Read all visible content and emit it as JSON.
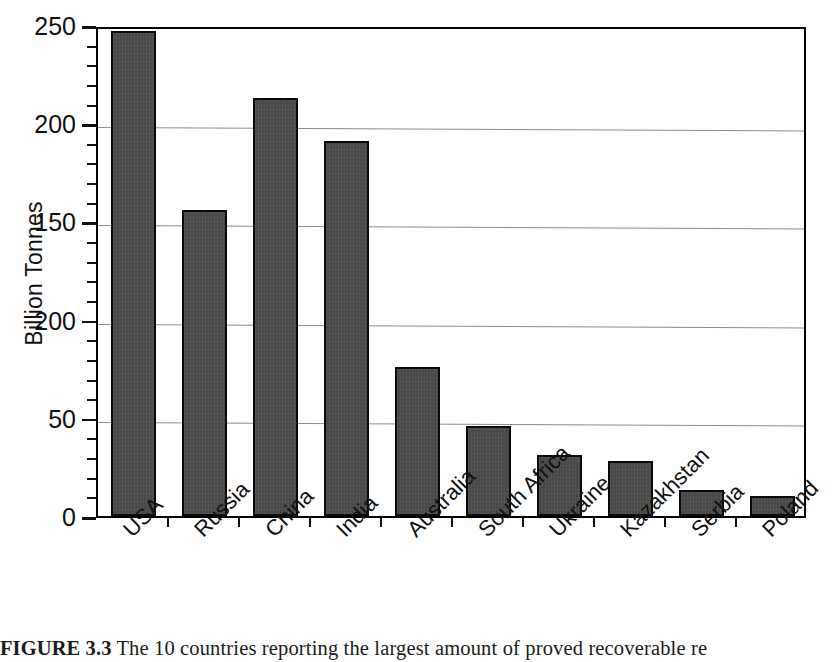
{
  "figure": {
    "caption_label": "FIGURE 3.3",
    "caption_text": " The 10 countries reporting the largest amount of proved recoverable re"
  },
  "axes": {
    "ylabel": "Billion Tonnes",
    "ytick_labels": [
      "250",
      "200",
      "150",
      "200",
      "50",
      "0"
    ],
    "ytick_values": [
      250,
      200,
      150,
      100,
      50,
      0
    ],
    "ylim": [
      0,
      250
    ],
    "major_step": 50,
    "minor_step": 10,
    "grid": "horizontal",
    "frame": "box"
  },
  "chart_data": {
    "type": "bar",
    "title": "",
    "xlabel": "",
    "ylabel": "Billion Tonnes",
    "ylim": [
      0,
      250
    ],
    "grid": true,
    "legend": "none",
    "categories": [
      "USA",
      "Russia",
      "China",
      "India",
      "Australia",
      "South Africa",
      "Ukraine",
      "Kazakhstan",
      "Serbia",
      "Poland"
    ],
    "values": [
      247,
      156,
      213,
      191,
      76,
      46,
      31,
      28,
      13,
      10
    ]
  },
  "style": {
    "bar_fill": "#474747",
    "bar_outline": "#0a0a0a",
    "grid_color": "#8d8d8d",
    "axis_color": "#000000",
    "background": "#ffffff"
  }
}
